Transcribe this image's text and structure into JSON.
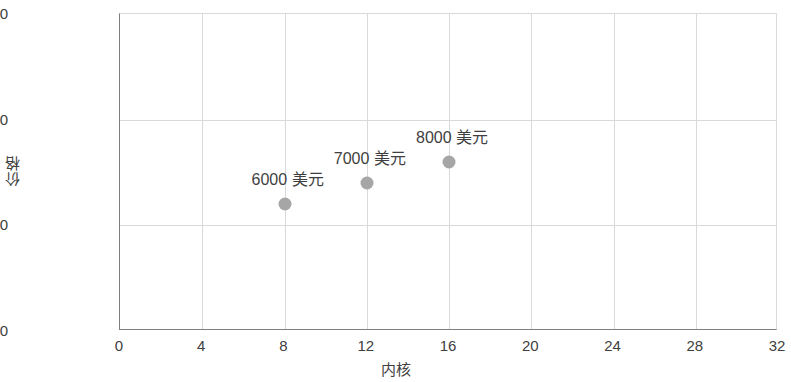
{
  "chart_data": {
    "type": "scatter",
    "title": "",
    "xlabel": "内核",
    "ylabel": "价格",
    "xlim": [
      0,
      32
    ],
    "ylim": [
      0,
      15000
    ],
    "grid": true,
    "legend": "none",
    "marker_color": "#a6a6a6",
    "x": [
      8,
      12,
      16
    ],
    "y": [
      6000,
      7000,
      8000
    ],
    "xticks": [
      "0",
      "4",
      "8",
      "12",
      "16",
      "20",
      "24",
      "28",
      "32"
    ],
    "xtick_values": [
      0,
      4,
      8,
      12,
      16,
      20,
      24,
      28,
      32
    ],
    "yticks": [
      "$0",
      "$5,000",
      "$10,000",
      "$15,000"
    ],
    "ytick_values": [
      0,
      5000,
      10000,
      15000
    ],
    "points": [
      {
        "x": 8,
        "y": 6000,
        "label": "6000 美元"
      },
      {
        "x": 12,
        "y": 7000,
        "label": "7000 美元"
      },
      {
        "x": 16,
        "y": 8000,
        "label": "8000 美元"
      }
    ]
  }
}
